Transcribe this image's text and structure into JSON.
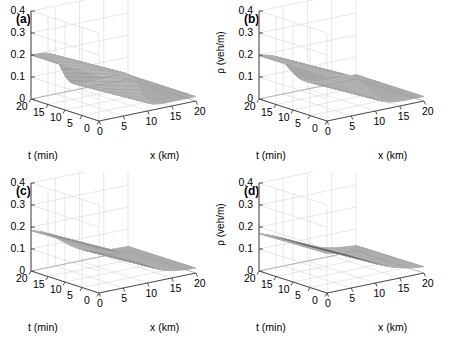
{
  "figure": {
    "type": "multi-panel-3d-surface-figure",
    "panel_count": 4,
    "layout": "2x2"
  },
  "panels": [
    {
      "label": "(a)",
      "name": "panel-a",
      "spread": 0.045,
      "shock_center": 0.4
    },
    {
      "label": "(b)",
      "name": "panel-b",
      "spread": 0.075,
      "shock_center": 0.4
    },
    {
      "label": "(c)",
      "name": "panel-c",
      "spread": 0.135,
      "shock_center": 0.4
    },
    {
      "label": "(d)",
      "name": "panel-d",
      "spread": 0.195,
      "shock_center": 0.4
    }
  ],
  "axes": {
    "z": {
      "label": "ρ (veh/m)",
      "ticks": [
        "0.4",
        "0.3",
        "0.2",
        "0.1",
        "0"
      ],
      "min": 0,
      "max": 0.4
    },
    "x": {
      "label": "x (km)",
      "ticks": [
        "0",
        "5",
        "10",
        "15",
        "20"
      ],
      "min": 0,
      "max": 20
    },
    "t": {
      "label": "t (min)",
      "ticks": [
        "20",
        "15",
        "10",
        "5",
        "0"
      ],
      "min": 0,
      "max": 20
    }
  },
  "chart_data": {
    "type": "line",
    "subtype": "3d-mesh-surface",
    "title": "",
    "xlabel": "x (km)",
    "ylabel": "t (min)",
    "zlabel": "ρ (veh/m)",
    "xlim": [
      0,
      20
    ],
    "ylim": [
      0,
      20
    ],
    "zlim": [
      0,
      0.4
    ],
    "xticks": [
      0,
      5,
      10,
      15,
      20
    ],
    "yticks": [
      0,
      5,
      10,
      15,
      20
    ],
    "zticks": [
      0,
      0.1,
      0.2,
      0.3,
      0.4
    ],
    "grid": true,
    "legend": null,
    "colormap": "grayscale-mesh",
    "surface_description": "Traffic density rho as function of space x and time t; a high-density plateau of rho = 0.2 veh/m upstream drops through a travelling shock front down to a near-zero downstream state of rho = 0.02 veh/m.",
    "plateau_value": 0.2,
    "downstream_value": 0.02,
    "series": [
      {
        "name": "(a)",
        "shock_width_km": 1.8,
        "plateau_rho": 0.2,
        "downstream_rho": 0.02,
        "shock_front_x_at_t0": 8.0,
        "shock_front_x_at_t20": 6.0
      },
      {
        "name": "(b)",
        "shock_width_km": 3.0,
        "plateau_rho": 0.2,
        "downstream_rho": 0.02,
        "shock_front_x_at_t0": 8.0,
        "shock_front_x_at_t20": 6.0
      },
      {
        "name": "(c)",
        "shock_width_km": 5.4,
        "plateau_rho": 0.2,
        "downstream_rho": 0.02,
        "shock_front_x_at_t0": 8.0,
        "shock_front_x_at_t20": 6.0
      },
      {
        "name": "(d)",
        "shock_width_km": 7.8,
        "plateau_rho": 0.2,
        "downstream_rho": 0.02,
        "shock_front_x_at_t0": 8.0,
        "shock_front_x_at_t20": 6.0
      }
    ]
  }
}
